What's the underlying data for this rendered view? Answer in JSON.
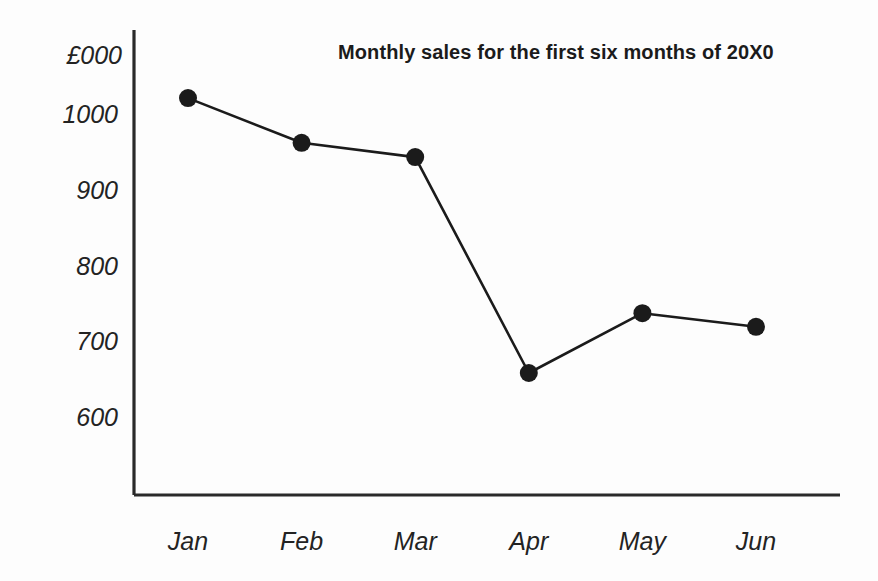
{
  "chart_data": {
    "type": "line",
    "title": "Monthly sales for the first six months of 20X0",
    "xlabel": "",
    "ylabel": "£000",
    "categories": [
      "Jan",
      "Feb",
      "Mar",
      "Apr",
      "May",
      "Jun"
    ],
    "values": [
      1025,
      966,
      947,
      662,
      741,
      723
    ],
    "series": [
      {
        "name": "Monthly sales",
        "values": [
          1025,
          966,
          947,
          662,
          741,
          723
        ]
      }
    ],
    "ytick_labels": [
      "1000",
      "900",
      "800",
      "700",
      "600"
    ],
    "ytick_values": [
      1000,
      900,
      800,
      700,
      600
    ],
    "ylim": [
      560,
      1060
    ],
    "xtick_labels": [
      "Jan",
      "Feb",
      "Mar",
      "Apr",
      "May",
      "Jun"
    ],
    "grid": false,
    "legend": false,
    "legend_position": "none",
    "marker": "filled-circle",
    "line_color": "#1b1b1b",
    "marker_color": "#1b1b1b",
    "axis_color": "#2a2a2a",
    "background_color": "#fdfdfd"
  },
  "axes": {
    "unit_label": "£000"
  }
}
